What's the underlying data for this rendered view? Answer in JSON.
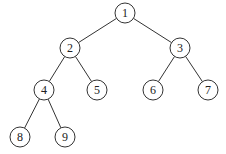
{
  "diagram": {
    "type": "binary-tree",
    "node_radius": 10,
    "nodes": [
      {
        "id": "1",
        "label": "1",
        "x": 125,
        "y": 13
      },
      {
        "id": "2",
        "label": "2",
        "x": 70,
        "y": 48
      },
      {
        "id": "3",
        "label": "3",
        "x": 180,
        "y": 48
      },
      {
        "id": "4",
        "label": "4",
        "x": 44,
        "y": 90
      },
      {
        "id": "5",
        "label": "5",
        "x": 97,
        "y": 90
      },
      {
        "id": "6",
        "label": "6",
        "x": 153,
        "y": 90
      },
      {
        "id": "7",
        "label": "7",
        "x": 208,
        "y": 90
      },
      {
        "id": "8",
        "label": "8",
        "x": 20,
        "y": 137
      },
      {
        "id": "9",
        "label": "9",
        "x": 65,
        "y": 137
      }
    ],
    "edges": [
      {
        "from": "1",
        "to": "2"
      },
      {
        "from": "1",
        "to": "3"
      },
      {
        "from": "2",
        "to": "4"
      },
      {
        "from": "2",
        "to": "5"
      },
      {
        "from": "3",
        "to": "6"
      },
      {
        "from": "3",
        "to": "7"
      },
      {
        "from": "4",
        "to": "8"
      },
      {
        "from": "4",
        "to": "9"
      }
    ]
  }
}
